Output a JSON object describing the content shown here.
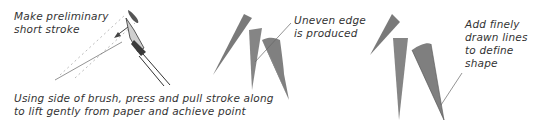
{
  "annotations": {
    "step1_top": [
      "Make preliminary",
      "short stroke"
    ],
    "step1_bottom": [
      "Using side of brush, press and pull stroke along",
      "to lift gently from paper and achieve point"
    ],
    "step2": [
      "Uneven edge",
      "is produced"
    ],
    "step3": [
      "Add finely",
      "drawn lines",
      "to define",
      "shape"
    ]
  },
  "colors": {
    "stroke_fill": "#7a7a7a",
    "stroke_dark": "#5e5e5e",
    "text": "#333333",
    "leader_line": "#666666"
  },
  "illustrations": [
    {
      "name": "brush-with-preliminary-stroke"
    },
    {
      "name": "three-strokes-uneven-edge"
    },
    {
      "name": "three-strokes-refined"
    }
  ]
}
